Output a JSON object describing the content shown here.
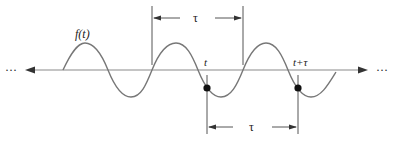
{
  "diagram": {
    "function_label": "f(t)",
    "point_t_label": "t",
    "point_t_tau_label": "t+τ",
    "top_interval_label": "τ",
    "bottom_interval_label": "τ",
    "left_ellipsis": "···",
    "right_ellipsis": "···",
    "colors": {
      "axis": "#888888",
      "wave": "#777777",
      "lines": "#555555",
      "dots": "#111111",
      "text": "#222222"
    }
  }
}
